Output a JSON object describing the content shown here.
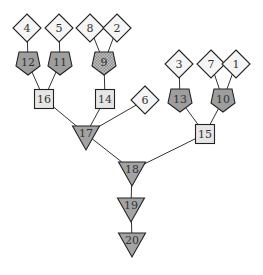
{
  "diagram": {
    "type": "tree",
    "colors": {
      "diamond_fill": "#f5f5f5",
      "square_fill": "#e6e6e6",
      "pentagon_fill": "#9e9e9e",
      "pentagon_hatched_fill": "#b0b0b0",
      "triangle_fill": "#a3a3a3",
      "stroke": "#222222"
    },
    "nodes": [
      {
        "id": "4",
        "label": "4",
        "shape": "diamond",
        "x": 27,
        "y": 28
      },
      {
        "id": "5",
        "label": "5",
        "shape": "diamond",
        "x": 59,
        "y": 28
      },
      {
        "id": "8",
        "label": "8",
        "shape": "diamond",
        "x": 90,
        "y": 28
      },
      {
        "id": "2",
        "label": "2",
        "shape": "diamond",
        "x": 117,
        "y": 28
      },
      {
        "id": "3",
        "label": "3",
        "shape": "diamond",
        "x": 179,
        "y": 64
      },
      {
        "id": "7",
        "label": "7",
        "shape": "diamond",
        "x": 211,
        "y": 64
      },
      {
        "id": "1",
        "label": "1",
        "shape": "diamond",
        "x": 236,
        "y": 64
      },
      {
        "id": "6",
        "label": "6",
        "shape": "diamond",
        "x": 145,
        "y": 100
      },
      {
        "id": "12",
        "label": "12",
        "shape": "pentagon",
        "x": 28,
        "y": 63
      },
      {
        "id": "11",
        "label": "11",
        "shape": "pentagon",
        "x": 60,
        "y": 63
      },
      {
        "id": "9",
        "label": "9",
        "shape": "pentagon-hatched",
        "x": 104,
        "y": 63
      },
      {
        "id": "13",
        "label": "13",
        "shape": "pentagon",
        "x": 180,
        "y": 100
      },
      {
        "id": "10",
        "label": "10",
        "shape": "pentagon",
        "x": 223,
        "y": 100
      },
      {
        "id": "16",
        "label": "16",
        "shape": "square",
        "x": 44,
        "y": 99
      },
      {
        "id": "14",
        "label": "14",
        "shape": "square",
        "x": 105,
        "y": 99
      },
      {
        "id": "15",
        "label": "15",
        "shape": "square",
        "x": 205,
        "y": 134
      },
      {
        "id": "17",
        "label": "17",
        "shape": "triangle",
        "x": 86,
        "y": 134
      },
      {
        "id": "18",
        "label": "18",
        "shape": "triangle",
        "x": 132,
        "y": 170
      },
      {
        "id": "19",
        "label": "19",
        "shape": "triangle",
        "x": 131,
        "y": 206
      },
      {
        "id": "20",
        "label": "20",
        "shape": "triangle",
        "x": 132,
        "y": 241
      }
    ],
    "edges": [
      [
        "4",
        "12"
      ],
      [
        "5",
        "11"
      ],
      [
        "8",
        "9"
      ],
      [
        "2",
        "9"
      ],
      [
        "12",
        "16"
      ],
      [
        "11",
        "16"
      ],
      [
        "9",
        "14"
      ],
      [
        "16",
        "17"
      ],
      [
        "14",
        "17"
      ],
      [
        "6",
        "17"
      ],
      [
        "3",
        "13"
      ],
      [
        "7",
        "10"
      ],
      [
        "1",
        "10"
      ],
      [
        "13",
        "15"
      ],
      [
        "10",
        "15"
      ],
      [
        "17",
        "18"
      ],
      [
        "15",
        "18"
      ],
      [
        "18",
        "19"
      ],
      [
        "19",
        "20"
      ]
    ]
  }
}
